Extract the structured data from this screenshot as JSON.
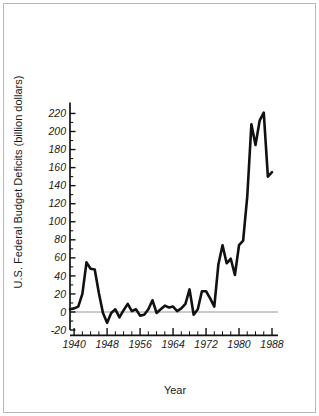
{
  "figure": {
    "background": "#ffffff",
    "frame_color": "#b9b9b9",
    "line_color": "#111111",
    "zero_line_color": "#8a8a8a"
  },
  "chart_data": {
    "type": "line",
    "title": "",
    "xlabel": "Year",
    "ylabel": "U.S. Federal Budget Deficits (billion dollars)",
    "xlim": [
      1939,
      1988
    ],
    "ylim": [
      -28,
      232
    ],
    "grid": false,
    "legend": null,
    "x_major_ticks": [
      1940,
      1948,
      1956,
      1964,
      1972,
      1980,
      1988
    ],
    "x_major_tick_labels": [
      "1940",
      "1948",
      "1956",
      "1964",
      "1972",
      "1980",
      "1988"
    ],
    "x_minor_tick_step": 2,
    "y_major_ticks": [
      -20,
      0,
      20,
      40,
      60,
      80,
      100,
      120,
      140,
      160,
      180,
      200,
      220
    ],
    "y_major_tick_labels": [
      "-20",
      "0",
      "20",
      "40",
      "60",
      "80",
      "100",
      "120",
      "140",
      "160",
      "180",
      "200",
      "220"
    ],
    "y_minor_tick_step": 10,
    "zero_reference_line": 0,
    "series": [
      {
        "name": "U.S. Federal Budget Deficit",
        "x": [
          1939,
          1940,
          1941,
          1942,
          1943,
          1944,
          1945,
          1946,
          1947,
          1948,
          1949,
          1950,
          1951,
          1952,
          1953,
          1954,
          1955,
          1956,
          1957,
          1958,
          1959,
          1960,
          1961,
          1962,
          1963,
          1964,
          1965,
          1966,
          1967,
          1968,
          1969,
          1970,
          1971,
          1972,
          1973,
          1974,
          1975,
          1976,
          1977,
          1978,
          1979,
          1980,
          1981,
          1982,
          1983,
          1984,
          1985,
          1986,
          1987,
          1988
        ],
        "values": [
          3,
          4,
          6,
          20,
          55,
          48,
          47,
          21,
          -1,
          -12,
          -1,
          3,
          -6,
          2,
          9,
          1,
          3,
          -4,
          -3,
          3,
          13,
          -1,
          3,
          7,
          5,
          6,
          1,
          4,
          9,
          25,
          -3,
          3,
          23,
          23,
          15,
          6,
          53,
          74,
          54,
          59,
          41,
          74,
          79,
          128,
          208,
          185,
          212,
          221,
          150,
          155
        ]
      }
    ]
  }
}
